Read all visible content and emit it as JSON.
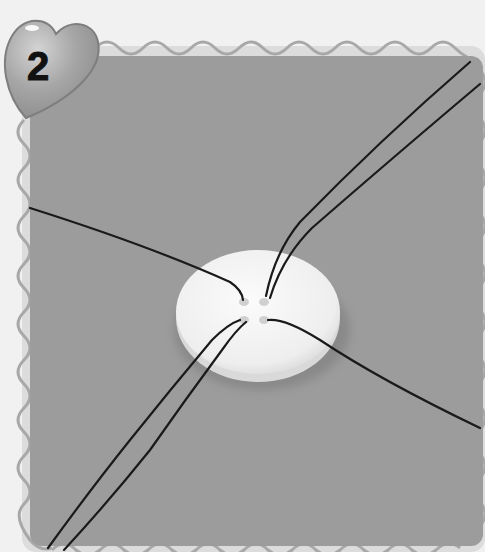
{
  "step": {
    "number": "2",
    "badge_shape": "heart-icon"
  },
  "photo": {
    "subject": "white four-hole button with black threads crossing through the holes",
    "background_color": "#9c9c9c",
    "button_color": "#f2f2f2",
    "thread_color": "#1a1a1a",
    "frame_color": "#a8a8a8",
    "page_color": "#f1f1f1",
    "heart_color": "#9a9a9a"
  }
}
